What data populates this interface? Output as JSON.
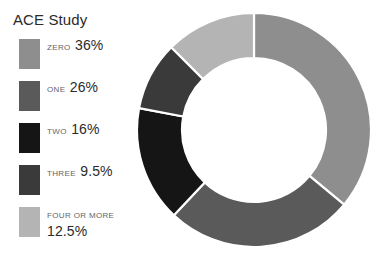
{
  "chart_data": {
    "type": "pie",
    "variant": "donut",
    "title": "ACE Study",
    "xlabel": "",
    "ylabel": "",
    "legend_position": "left",
    "grid": false,
    "start_angle_deg": 0,
    "direction": "clockwise",
    "inner_radius_ratio": 0.615,
    "categories": [
      "ZERO",
      "ONE",
      "TWO",
      "THREE",
      "FOUR OR MORE"
    ],
    "values": [
      36,
      26,
      16,
      9.5,
      12.5
    ],
    "value_labels": [
      "36%",
      "26%",
      "16%",
      "9.5%",
      "12.5%"
    ],
    "colors": [
      "#8e8e8e",
      "#5a5a5a",
      "#151515",
      "#3a3a3a",
      "#b4b4b4"
    ],
    "slices": [
      {
        "label": "ZERO",
        "value": 36,
        "value_label": "36%",
        "color": "#8e8e8e"
      },
      {
        "label": "ONE",
        "value": 26,
        "value_label": "26%",
        "color": "#5a5a5a"
      },
      {
        "label": "TWO",
        "value": 16,
        "value_label": "16%",
        "color": "#151515"
      },
      {
        "label": "THREE",
        "value": 9.5,
        "value_label": "9.5%",
        "color": "#3a3a3a"
      },
      {
        "label": "FOUR OR MORE",
        "value": 12.5,
        "value_label": "12.5%",
        "color": "#b4b4b4"
      }
    ]
  },
  "separator_color": "#ffffff",
  "background_color": "#ffffff"
}
